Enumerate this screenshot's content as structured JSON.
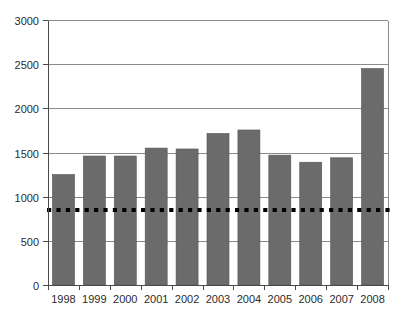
{
  "chart_data": {
    "type": "bar",
    "title": "",
    "subtitle": "",
    "xlabel": "",
    "ylabel": "",
    "categories": [
      "1998",
      "1999",
      "2000",
      "2001",
      "2002",
      "2003",
      "2004",
      "2005",
      "2006",
      "2007",
      "2008"
    ],
    "values": [
      1250,
      1460,
      1460,
      1550,
      1540,
      1715,
      1755,
      1470,
      1390,
      1440,
      2450
    ],
    "series": [
      {
        "name": "annual total",
        "values": [
          1250,
          1460,
          1460,
          1550,
          1540,
          1715,
          1755,
          1470,
          1390,
          1440,
          2450
        ],
        "color": "#6b6b6b"
      }
    ],
    "ylim": [
      0,
      3000
    ],
    "y_ticks": [
      0,
      500,
      1000,
      1500,
      2000,
      2500,
      3000
    ],
    "y_tick_labels": [
      "0",
      "500",
      "1000",
      "1500",
      "2000",
      "2500",
      "3000"
    ],
    "x_tick_labels": [
      "1998",
      "1999",
      "2000",
      "2001",
      "2002",
      "2003",
      "2004",
      "2005",
      "2006",
      "2007",
      "2008"
    ],
    "grid": true,
    "grid_axis": "y",
    "legend": false,
    "legend_position": "none",
    "annotations": [
      {
        "name": "reference-line",
        "type": "horizontal-dashed-line",
        "value": 850,
        "color": "#000000",
        "style": "dotted",
        "label": ""
      }
    ],
    "bar_color": "#6b6b6b",
    "bar_edge_color": "#545454",
    "plot_background": "#ffffff",
    "axis_color": "#4a4a4a",
    "gridline_color": "#8a8a8a"
  },
  "layout": {
    "plot_left": 48,
    "plot_right": 388,
    "plot_top": 20,
    "plot_bottom": 285
  }
}
